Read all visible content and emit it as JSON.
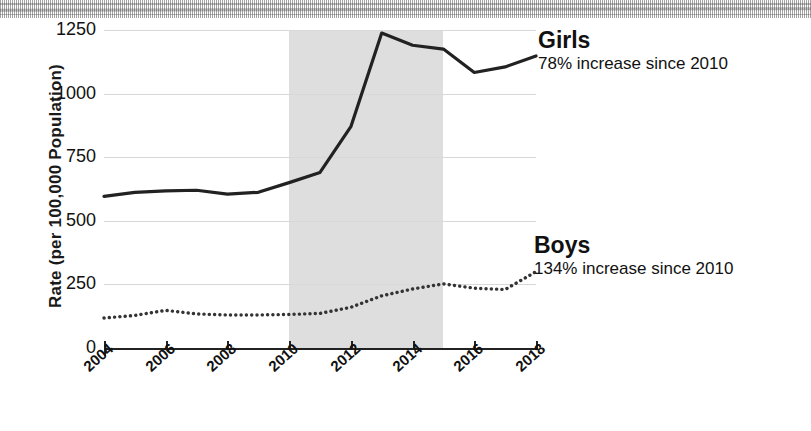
{
  "figure": {
    "background_color": "#ffffff",
    "ink_color": "#222222",
    "shaded_band_color": "#dedede",
    "gridline_color": "#d8d8d8"
  },
  "annotations": {
    "girls": {
      "title": "Girls",
      "subtitle": "78% increase since 2010"
    },
    "boys": {
      "title": "Boys",
      "subtitle": "134% increase since 2010"
    }
  },
  "chart_data": {
    "type": "line",
    "title": "",
    "xlabel": "",
    "ylabel": "Rate (per 100,000 Population)",
    "xlim": [
      2004,
      2018
    ],
    "ylim": [
      0,
      1250
    ],
    "grid": true,
    "legend_position": "right-inline-annotations",
    "y_ticks": [
      0,
      250,
      500,
      750,
      1000,
      1250
    ],
    "y_tick_labels": [
      "0",
      "250",
      "500",
      "750",
      "1000",
      "1250"
    ],
    "x_ticks": [
      2004,
      2006,
      2008,
      2010,
      2012,
      2014,
      2016,
      2018
    ],
    "x_tick_labels": [
      "2004",
      "2006",
      "2008",
      "2010",
      "2012",
      "2014",
      "2016",
      "2018"
    ],
    "shaded_region": {
      "x_start": 2010,
      "x_end": 2015,
      "label": ""
    },
    "x": [
      2004,
      2005,
      2006,
      2007,
      2008,
      2009,
      2010,
      2011,
      2012,
      2013,
      2014,
      2015,
      2016,
      2017,
      2018
    ],
    "series": [
      {
        "name": "Girls",
        "style": "solid",
        "color": "#222222",
        "values": [
          596,
          612,
          618,
          620,
          605,
          612,
          650,
          690,
          870,
          1238,
          1190,
          1175,
          1083,
          1105,
          1148
        ]
      },
      {
        "name": "Boys",
        "style": "dotted",
        "color": "#333333",
        "values": [
          118,
          128,
          148,
          134,
          130,
          130,
          132,
          136,
          160,
          205,
          232,
          252,
          235,
          230,
          300
        ]
      }
    ]
  }
}
